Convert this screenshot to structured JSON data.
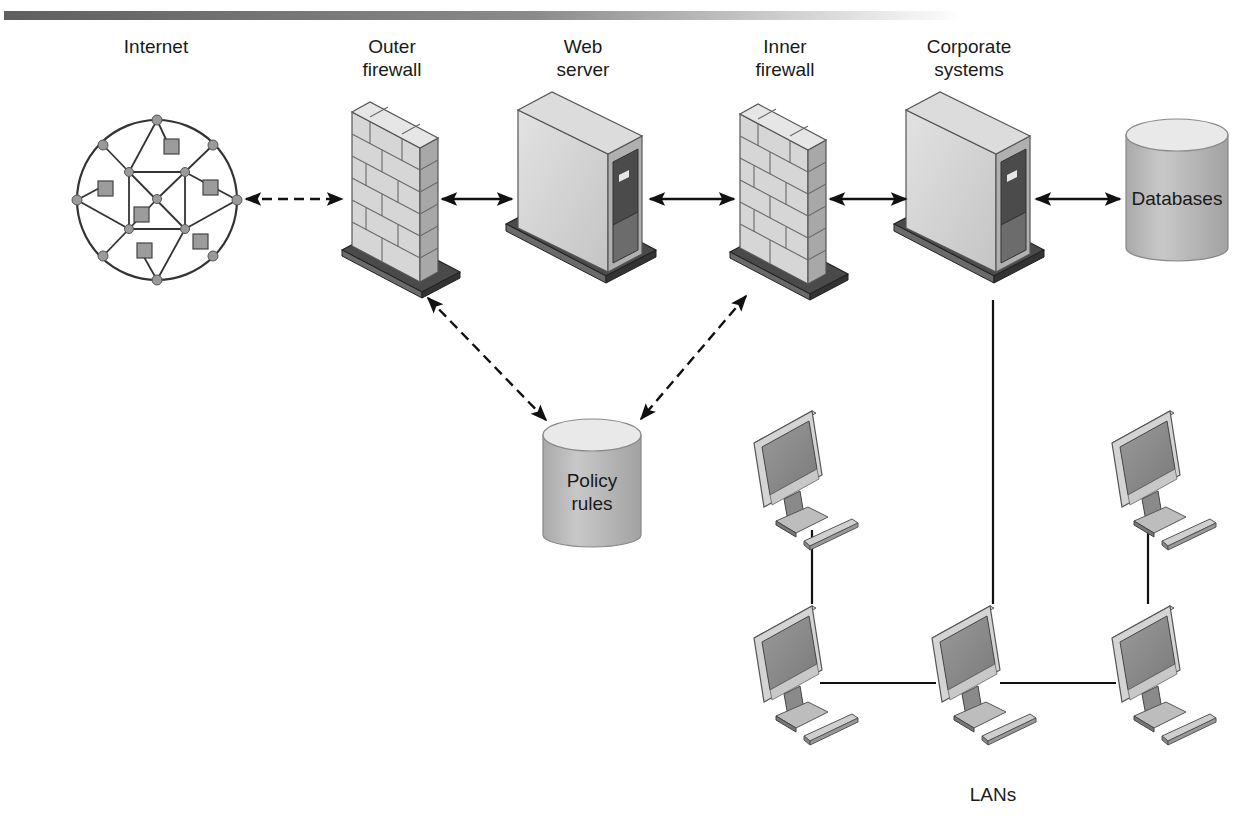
{
  "diagram": {
    "header_bar": {
      "gradient_from": "#6e6e6e",
      "gradient_to": "#ffffff"
    },
    "nodes": {
      "internet": {
        "label": "Internet"
      },
      "outer_firewall": {
        "label_line1": "Outer",
        "label_line2": "firewall"
      },
      "web_server": {
        "label_line1": "Web",
        "label_line2": "server"
      },
      "inner_firewall": {
        "label_line1": "Inner",
        "label_line2": "firewall"
      },
      "corporate_systems": {
        "label_line1": "Corporate",
        "label_line2": "systems"
      },
      "databases": {
        "label": "Databases"
      },
      "policy_rules": {
        "label_line1": "Policy",
        "label_line2": "rules"
      },
      "lans": {
        "label": "LANs",
        "workstation_count": 5
      }
    },
    "connections": [
      {
        "from": "Internet",
        "to": "Outer firewall",
        "style": "dashed",
        "direction": "bidirectional"
      },
      {
        "from": "Outer firewall",
        "to": "Web server",
        "style": "solid",
        "direction": "bidirectional"
      },
      {
        "from": "Web server",
        "to": "Inner firewall",
        "style": "solid",
        "direction": "bidirectional"
      },
      {
        "from": "Inner firewall",
        "to": "Corporate systems",
        "style": "solid",
        "direction": "bidirectional"
      },
      {
        "from": "Corporate systems",
        "to": "Databases",
        "style": "solid",
        "direction": "bidirectional"
      },
      {
        "from": "Outer firewall",
        "to": "Policy rules",
        "style": "dashed",
        "direction": "bidirectional"
      },
      {
        "from": "Inner firewall",
        "to": "Policy rules",
        "style": "dashed",
        "direction": "to-policy"
      },
      {
        "from": "Corporate systems",
        "to": "LANs",
        "style": "solid",
        "direction": "none"
      }
    ],
    "colors": {
      "line": "#111111",
      "device_light": "#d9d9d9",
      "device_mid": "#b8b8b8",
      "device_dark": "#555555",
      "screen": "#8c8c8c",
      "cylinder_top": "#e8e8e8",
      "cylinder_body": "#bdbdbd"
    }
  }
}
